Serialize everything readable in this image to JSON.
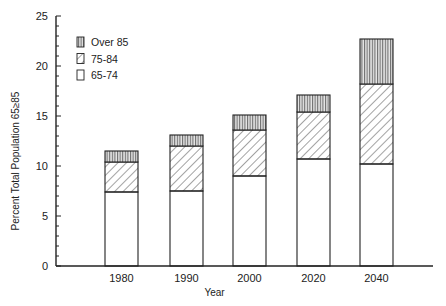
{
  "chart_data": {
    "type": "bar",
    "stacked": true,
    "title": "",
    "xlabel": "Year",
    "ylabel": "Percent Total Population 65≥85",
    "ylim": [
      0,
      25
    ],
    "yticks": [
      "0",
      "5",
      "10",
      "15",
      "20",
      "25"
    ],
    "categories": [
      "1980",
      "1990",
      "2000",
      "2020",
      "2040"
    ],
    "series": [
      {
        "name": "65-74",
        "pattern": "blank",
        "values": [
          7.4,
          7.5,
          9.0,
          10.7,
          10.2
        ]
      },
      {
        "name": "75-84",
        "pattern": "diagonal-hatch",
        "values": [
          3.0,
          4.5,
          4.6,
          4.7,
          8.0
        ]
      },
      {
        "name": "Over 85",
        "pattern": "vertical-lines",
        "values": [
          1.1,
          1.1,
          1.5,
          1.7,
          4.5
        ]
      }
    ],
    "totals": [
      11.5,
      13.1,
      15.1,
      17.1,
      22.7
    ],
    "legend": {
      "position": "upper-left",
      "entries": [
        "Over 85",
        "75-84",
        "65-74"
      ]
    },
    "grid": false
  }
}
